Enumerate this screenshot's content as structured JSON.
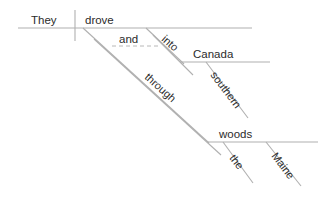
{
  "diagram": {
    "type": "reed-kellogg-sentence-diagram",
    "sentence": "They drove into southern Canada and through the Maine woods.",
    "colors": {
      "background": "#ffffff",
      "line": "#b0b0b0",
      "dashed_line": "#b8b8b8",
      "text": "#2b2b2b"
    },
    "words": {
      "subject": "They",
      "verb": "drove",
      "conjunction": "and",
      "preposition_1": "into",
      "object_1": "Canada",
      "modifier_1": "southern",
      "preposition_2": "through",
      "object_2": "woods",
      "modifier_2a": "the",
      "modifier_2b": "Maine"
    },
    "lines": {
      "baseline": {
        "x1": 18,
        "y1": 28,
        "x2": 252,
        "y2": 28
      },
      "subject_verb_divider": {
        "x1": 75,
        "y1": 10,
        "x2": 75,
        "y2": 41
      },
      "canada_baseline": {
        "x1": 180,
        "y1": 62,
        "x2": 270,
        "y2": 62
      },
      "woods_baseline": {
        "x1": 208,
        "y1": 142,
        "x2": 318,
        "y2": 142
      },
      "into_diagonal": {
        "x1": 146,
        "y1": 28,
        "x2": 182,
        "y2": 62
      },
      "into_tail": {
        "x1": 156,
        "y1": 38,
        "x2": 195,
        "y2": 76
      },
      "through_diagonal": {
        "x1": 83,
        "y1": 28,
        "x2": 208,
        "y2": 142
      },
      "through_tail": {
        "x1": 95,
        "y1": 40,
        "x2": 221,
        "y2": 156
      },
      "conjunction_dashed": {
        "x1": 110,
        "y1": 46,
        "x2": 160,
        "y2": 46
      },
      "southern_diagonal": {
        "x1": 205,
        "y1": 62,
        "x2": 247,
        "y2": 117
      },
      "the_diagonal": {
        "x1": 222,
        "y1": 142,
        "x2": 252,
        "y2": 182
      },
      "maine_diagonal": {
        "x1": 265,
        "y1": 142,
        "x2": 300,
        "y2": 184
      }
    }
  }
}
